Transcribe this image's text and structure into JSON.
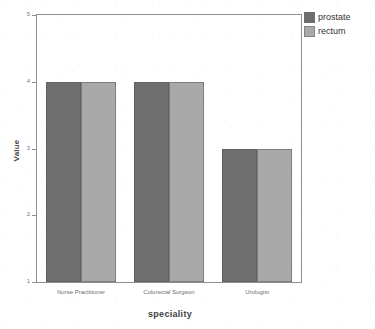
{
  "chart_data": {
    "type": "bar",
    "title": "",
    "subtitle": "",
    "xlabel": "speciality",
    "ylabel": "Value",
    "categories": [
      "Nurse Practitioner",
      "Colorectal Surgeon",
      "Urologist"
    ],
    "series": [
      {
        "name": "prostate",
        "values": [
          4,
          4,
          3
        ],
        "color": "#6e6e6e"
      },
      {
        "name": "rectum",
        "values": [
          4,
          4,
          3
        ],
        "color": "#a9a9a9"
      }
    ],
    "ylim": [
      1,
      5
    ],
    "yticks": [
      1,
      2,
      3,
      4,
      5
    ],
    "ytick_labels": [
      "1",
      "2",
      "3",
      "4",
      "5"
    ],
    "xlim_categories": 3,
    "grid": false,
    "legend_position": "top-right-outside",
    "frame": true
  },
  "legend": {
    "items": [
      {
        "label": "prostate",
        "swatch": "prostate-swatch"
      },
      {
        "label": "rectum",
        "swatch": "rectum-swatch"
      }
    ]
  },
  "axes": {
    "y": {
      "title": "Value",
      "ticks": [
        {
          "value": 5,
          "label": "5"
        },
        {
          "value": 4,
          "label": "4"
        },
        {
          "value": 3,
          "label": "3"
        },
        {
          "value": 2,
          "label": "2"
        },
        {
          "value": 1,
          "label": "1"
        }
      ]
    },
    "x": {
      "title": "speciality",
      "ticks": [
        {
          "label": "Nurse Practitioner"
        },
        {
          "label": "Colorectal Surgeon"
        },
        {
          "label": "Urologist"
        }
      ]
    }
  },
  "colors": {
    "prostate": "#6e6e6e",
    "rectum": "#a9a9a9",
    "frame": "#8e8e8e",
    "axis_text": "#6e6e6e",
    "title_text": "#3f3f3f",
    "background": "#ffffff"
  }
}
